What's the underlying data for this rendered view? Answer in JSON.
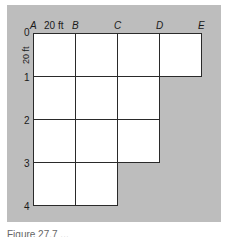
{
  "figure": {
    "column_labels": [
      "A",
      "B",
      "C",
      "D",
      "E"
    ],
    "row_labels": [
      "0",
      "1",
      "2",
      "3",
      "4"
    ],
    "horizontal_dimension": "20 ft",
    "vertical_dimension": "20 ft",
    "grid": {
      "cell_size_ft": 20,
      "rows": [
        {
          "row": "0-1",
          "columns": [
            "A-B",
            "B-C",
            "C-D",
            "D-E"
          ]
        },
        {
          "row": "1-2",
          "columns": [
            "A-B",
            "B-C",
            "C-D"
          ]
        },
        {
          "row": "2-3",
          "columns": [
            "A-B",
            "B-C",
            "C-D"
          ]
        },
        {
          "row": "3-4",
          "columns": [
            "A-B",
            "B-C"
          ]
        }
      ]
    },
    "caption": "Figure 27.7 ..."
  },
  "colors": {
    "background_panel": "#bdbdbd",
    "cell_fill": "#ffffff",
    "grid_line": "#2a2a2a"
  }
}
